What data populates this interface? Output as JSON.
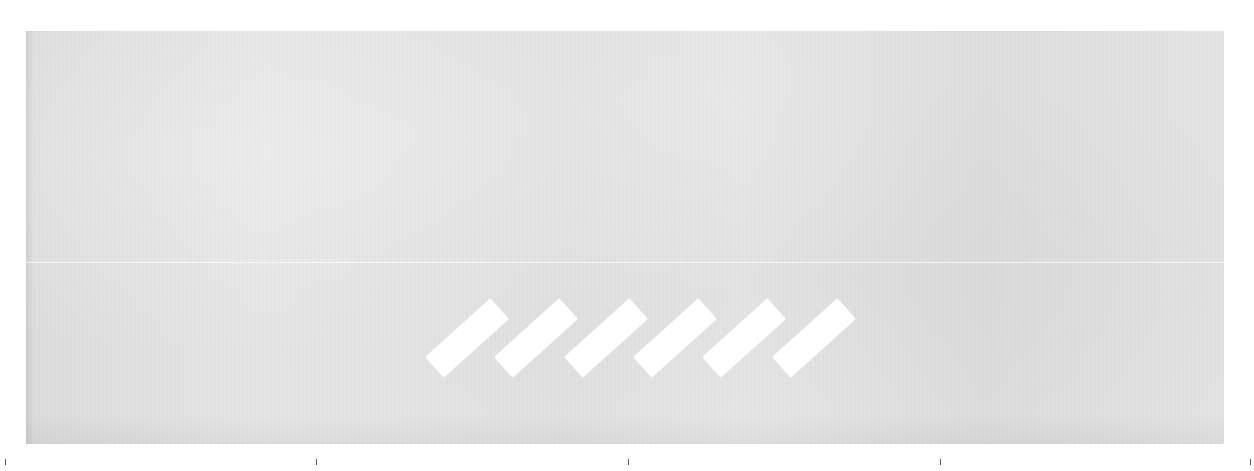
{
  "image": {
    "description": "Light gray fabric textile swatch with a faint horizontal seam and six diagonal white stripes near the bottom center",
    "fabric_color": "#e2e2e2",
    "stripe_color": "#ffffff",
    "background_color": "#ffffff"
  },
  "stripes": [
    {
      "cx": 467
    },
    {
      "cx": 536
    },
    {
      "cx": 606
    },
    {
      "cx": 675
    },
    {
      "cx": 744
    },
    {
      "cx": 814
    }
  ],
  "ticks": [
    5,
    316,
    628,
    940,
    1250
  ]
}
